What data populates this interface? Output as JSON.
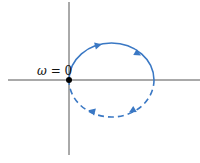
{
  "diagram": {
    "type": "nyquist-plot",
    "origin_label": "ω = 0",
    "origin_symbol": "ω",
    "origin_value": "= 0",
    "colors": {
      "axes": "#555555",
      "curve": "#3a78c4",
      "origin_dot": "#000000"
    },
    "curve": {
      "upper_half": "solid",
      "lower_half": "dashed",
      "direction": "clockwise"
    }
  }
}
